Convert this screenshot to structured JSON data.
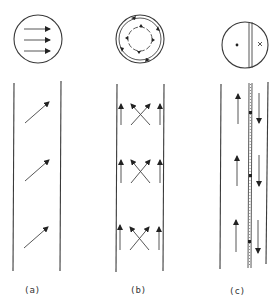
{
  "figure": {
    "panels": [
      {
        "id": "a",
        "label": "(a)",
        "circle_icon": "parallel-arrows",
        "strip_arrows": "diagonal"
      },
      {
        "id": "b",
        "label": "(b)",
        "circle_icon": "concentric-rotation",
        "strip_arrows": "crossed-with-wall-arrows"
      },
      {
        "id": "c",
        "label": "(c)",
        "circle_icon": "dot-cross-split",
        "strip_arrows": "counterflow-with-center-wall"
      }
    ]
  }
}
